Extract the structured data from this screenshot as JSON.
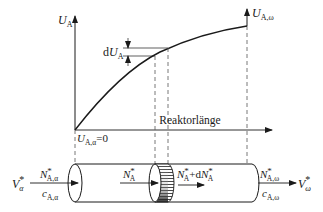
{
  "figure": {
    "y_axis_label": {
      "main": "U",
      "sub": "A"
    },
    "y_axis_right_label": {
      "main": "U",
      "sub": "A,ω"
    },
    "origin_label": {
      "main": "U",
      "sub": "A,α",
      "suffix": "=0"
    },
    "differential_label": {
      "prefix": "d",
      "main": "U",
      "sub": "A"
    },
    "x_axis_label": "Reaktorlänge",
    "reactor": {
      "inlet_flow": {
        "main": "V",
        "sup": "*",
        "sub": "α"
      },
      "inlet_molar": {
        "main": "N",
        "sup": "*",
        "sub": "A,α"
      },
      "inlet_conc": {
        "main": "c",
        "sub": "A,α"
      },
      "element_in": {
        "main": "N",
        "sup": "*",
        "sub": "A"
      },
      "element_out": {
        "main": "N",
        "sup": "*",
        "sub": "A",
        "plus": "+d",
        "main2": "N",
        "sup2": "*",
        "sub2": "A"
      },
      "outlet_molar": {
        "main": "N",
        "sup": "*",
        "sub": "A,ω"
      },
      "outlet_conc": {
        "main": "c",
        "sub": "A,ω"
      },
      "outlet_flow": {
        "main": "V",
        "sup": "*",
        "sub": "ω"
      }
    }
  },
  "colors": {
    "ink": "#1a1a1a",
    "dashed": "#555555",
    "background": "#ffffff"
  }
}
